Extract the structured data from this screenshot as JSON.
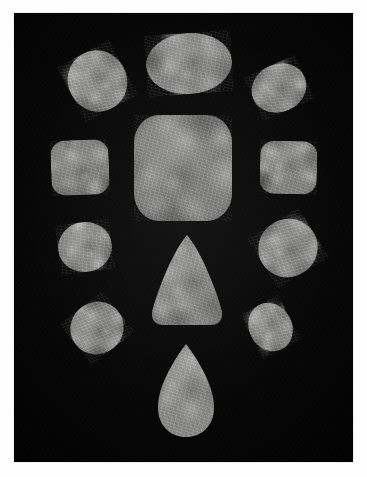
{
  "image": {
    "title": "Photograph of twelve polished stone specimens on black background",
    "medium": "photograph",
    "width": 367,
    "height": 477,
    "border_color": "#fefefe",
    "background_color": "#050505",
    "plate": {
      "x": 14,
      "y": 13,
      "width": 339,
      "height": 449
    }
  },
  "palette": {
    "stone_light": "#9a9a98",
    "stone_mid": "#808080",
    "stone_dark": "#5c5c5c",
    "field_black": "#050505",
    "mat_white": "#fefefe"
  },
  "specimens": [
    {
      "id": "top-left-oval",
      "name": "Top-left ovoid pebble",
      "shape": "ellipse",
      "x": 68,
      "y": 50,
      "width": 59,
      "height": 62,
      "rotation": -28,
      "tone": "#8d8d8b",
      "brightness": "light"
    },
    {
      "id": "top-center-oval",
      "name": "Top-centre large oval pebble",
      "shape": "ellipse",
      "x": 146,
      "y": 33,
      "width": 86,
      "height": 61,
      "rotation": -4,
      "tone": "#8a8a88",
      "brightness": "light"
    },
    {
      "id": "top-right-oval",
      "name": "Top-right ovoid pebble",
      "shape": "ellipse",
      "x": 251,
      "y": 64,
      "width": 56,
      "height": 48,
      "rotation": -24,
      "tone": "#878785",
      "brightness": "light"
    },
    {
      "id": "left-rounded-square",
      "name": "Left-middle rounded square tile",
      "shape": "squircle",
      "x": 51,
      "y": 140,
      "width": 58,
      "height": 55,
      "rotation": -2,
      "tone": "#848482",
      "brightness": "mid"
    },
    {
      "id": "center-large-square",
      "name": "Central large rounded square slab",
      "shape": "squircle",
      "x": 134,
      "y": 115,
      "width": 98,
      "height": 106,
      "rotation": 0,
      "tone": "#858583",
      "brightness": "mid"
    },
    {
      "id": "right-rounded-square",
      "name": "Right-middle rounded square tile",
      "shape": "squircle",
      "x": 260,
      "y": 141,
      "width": 57,
      "height": 53,
      "rotation": 1,
      "tone": "#868684",
      "brightness": "mid"
    },
    {
      "id": "left-small-oval",
      "name": "Left lower-middle oval pebble",
      "shape": "ellipse",
      "x": 58,
      "y": 222,
      "width": 54,
      "height": 50,
      "rotation": -8,
      "tone": "#8e8e8c",
      "brightness": "light"
    },
    {
      "id": "center-cone",
      "name": "Central conical / triangular stone",
      "shape": "cone",
      "x": 152,
      "y": 235,
      "width": 70,
      "height": 90,
      "rotation": 0,
      "tone": "#8b8b89",
      "brightness": "light"
    },
    {
      "id": "right-large-oval",
      "name": "Right lower-middle oval pebble",
      "shape": "ellipse",
      "x": 258,
      "y": 219,
      "width": 60,
      "height": 58,
      "rotation": -32,
      "tone": "#8a8a88",
      "brightness": "light"
    },
    {
      "id": "bottom-left-oval",
      "name": "Bottom-left elongated oval pebble",
      "shape": "ellipse",
      "x": 70,
      "y": 302,
      "width": 54,
      "height": 52,
      "rotation": -38,
      "tone": "#888886",
      "brightness": "mid"
    },
    {
      "id": "bottom-right-oval",
      "name": "Bottom-right small oval pebble",
      "shape": "ellipse",
      "x": 249,
      "y": 302,
      "width": 43,
      "height": 50,
      "rotation": -28,
      "tone": "#8c8c8a",
      "brightness": "light"
    },
    {
      "id": "bottom-teardrop",
      "name": "Bottom teardrop / pear-shaped stone",
      "shape": "teardrop",
      "x": 158,
      "y": 344,
      "width": 56,
      "height": 93,
      "rotation": 0,
      "tone": "#8d8d8b",
      "brightness": "light"
    }
  ],
  "counts": {
    "total_specimens": 12,
    "ellipses": 7,
    "squircles": 3,
    "cone": 1,
    "teardrop": 1
  }
}
